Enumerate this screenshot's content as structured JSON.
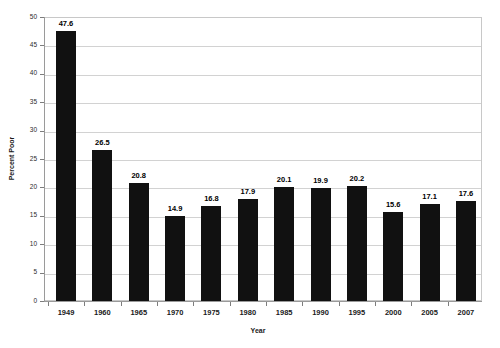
{
  "chart_data": {
    "type": "bar",
    "title": "",
    "xlabel": "Year",
    "ylabel": "Percent Poor",
    "categories": [
      "1949",
      "1960",
      "1965",
      "1970",
      "1975",
      "1980",
      "1985",
      "1990",
      "1995",
      "2000",
      "2005",
      "2007"
    ],
    "values": [
      47.6,
      26.5,
      20.8,
      14.9,
      16.8,
      17.9,
      20.1,
      19.9,
      20.2,
      15.6,
      17.1,
      17.6
    ],
    "data_labels": [
      "47.6",
      "26.5",
      "20.8",
      "14.9",
      "16.8",
      "17.9",
      "20.1",
      "19.9",
      "20.2",
      "15.6",
      "17.1",
      "17.6"
    ],
    "ylim": [
      0,
      50
    ],
    "ytick_values": [
      0,
      5,
      10,
      15,
      20,
      25,
      30,
      35,
      40,
      45,
      50
    ],
    "ytick_labels": [
      "0",
      "5",
      "10",
      "15",
      "20",
      "25",
      "30",
      "35",
      "40",
      "45",
      "50"
    ],
    "grid": "horizontal",
    "legend": "none",
    "bar_color": "#111111",
    "gridline_color": "#d2d2d2",
    "axis_color": "#9a9a9a",
    "background_color": "#ffffff"
  }
}
